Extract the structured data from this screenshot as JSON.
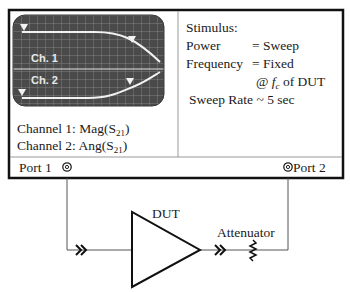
{
  "screen": {
    "channel1_label": "Ch. 1",
    "channel2_label": "Ch. 2",
    "background_color": "#4a4a4a",
    "grid_color": "#8c8c8c",
    "trace_color": "#f2f2f2"
  },
  "channels": {
    "ch1_prefix": "Channel 1: Mag(S",
    "ch1_sub": "21",
    "ch1_suffix": ")",
    "ch2_prefix": "Channel 2: Ang(S",
    "ch2_sub": "21",
    "ch2_suffix": ")"
  },
  "stimulus": {
    "title": "Stimulus:",
    "power_label": "Power",
    "power_value": "= Sweep",
    "frequency_label": "Frequency",
    "frequency_value": "= Fixed",
    "at_prefix": "@ ",
    "fc_symbol": "f",
    "fc_sub": "c",
    "at_suffix": " of DUT",
    "sweep_rate": "Sweep Rate ~ 5 sec"
  },
  "ports": {
    "port1": "Port 1",
    "port2": "Port 2"
  },
  "components": {
    "dut_label": "DUT",
    "attenuator_label": "Attenuator"
  }
}
